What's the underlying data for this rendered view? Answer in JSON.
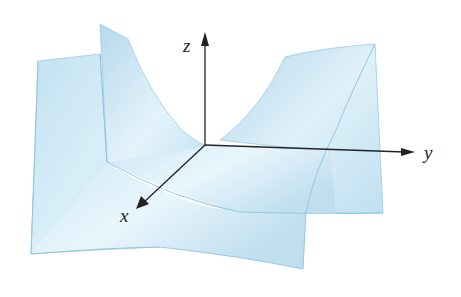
{
  "figure": {
    "surface_color": "#bfe0f0",
    "surface_highlight": "#e8f5fb",
    "edge_color": "#8cc3de",
    "axis_color": "#222226",
    "axes": {
      "z": {
        "label": "z"
      },
      "y": {
        "label": "y"
      },
      "x": {
        "label": "x"
      }
    }
  }
}
